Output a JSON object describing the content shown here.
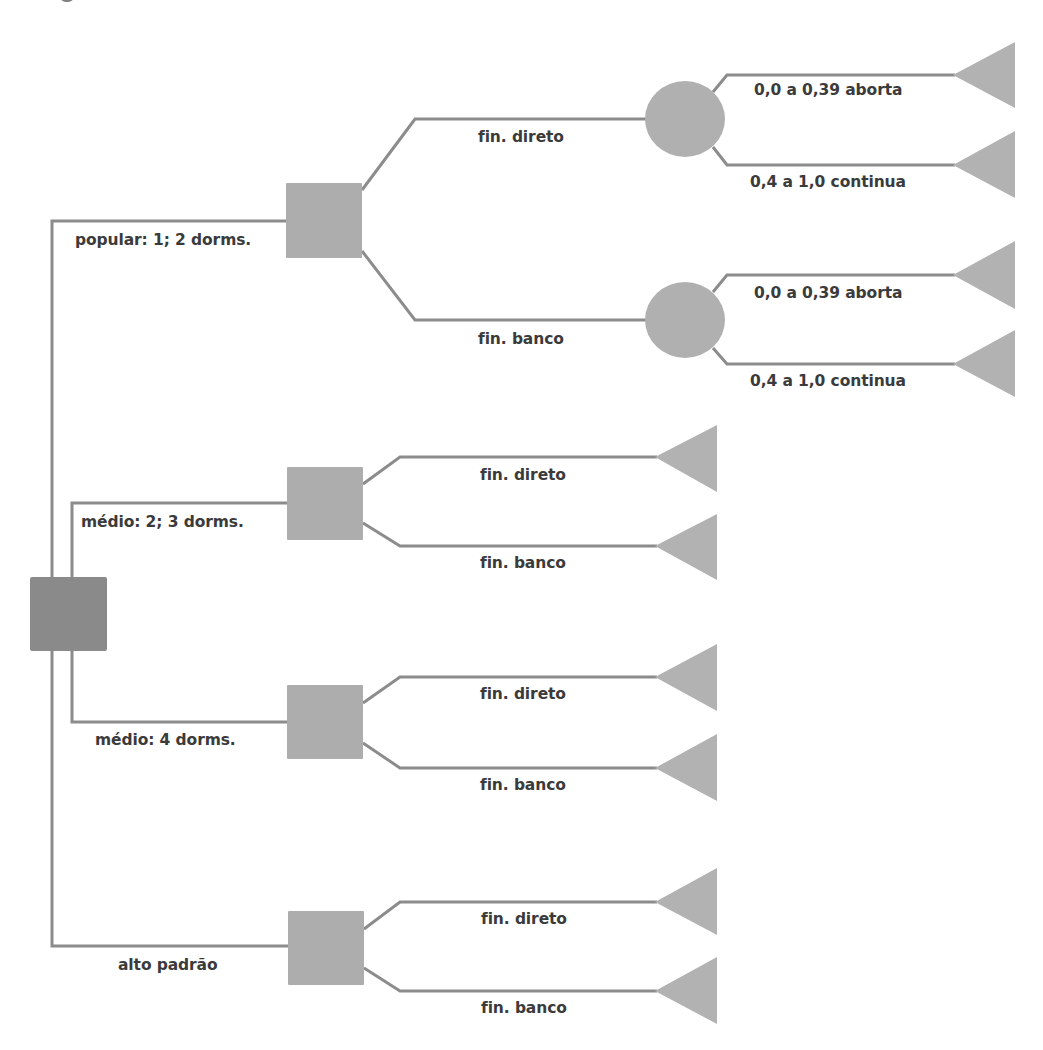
{
  "colors": {
    "line": "#8c8c8c",
    "root_node": "#8a8a8a",
    "decision_node": "#adadad",
    "chance_node": "#b0b0b0",
    "terminal_node": "#b2b2b2",
    "text": "#3b3b3b"
  },
  "tree": {
    "root": {
      "type": "decision"
    },
    "options": [
      {
        "label": "popular: 1; 2 dorms.",
        "branches": [
          {
            "label": "fin. direto",
            "chance": [
              {
                "label": "0,0 a 0,39 aborta"
              },
              {
                "label": "0,4 a 1,0 continua"
              }
            ]
          },
          {
            "label": "fin. banco",
            "chance": [
              {
                "label": "0,0 a 0,39 aborta"
              },
              {
                "label": "0,4 a 1,0 continua"
              }
            ]
          }
        ]
      },
      {
        "label": "médio: 2; 3 dorms.",
        "branches": [
          {
            "label": "fin. direto"
          },
          {
            "label": "fin. banco"
          }
        ]
      },
      {
        "label": "médio: 4 dorms.",
        "branches": [
          {
            "label": "fin. direto"
          },
          {
            "label": "fin. banco"
          }
        ]
      },
      {
        "label": "alto padrão",
        "branches": [
          {
            "label": "fin. direto"
          },
          {
            "label": "fin. banco"
          }
        ]
      }
    ]
  }
}
